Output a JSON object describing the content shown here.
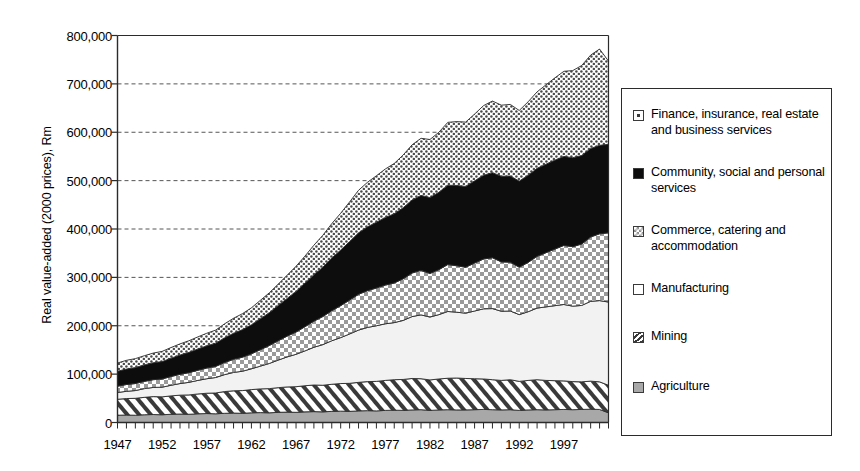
{
  "chart_data": {
    "type": "area",
    "stacked": true,
    "title": "",
    "xlabel": "",
    "ylabel": "Real value-added (2000 prices), Rm",
    "ylim": [
      0,
      800000
    ],
    "ytick_values": [
      0,
      100000,
      200000,
      300000,
      400000,
      500000,
      600000,
      700000,
      800000
    ],
    "ytick_labels": [
      "0",
      "100,000",
      "200,000",
      "300,000",
      "400,000",
      "500,000",
      "600,000",
      "700,000",
      "800,000"
    ],
    "xlim": [
      1947,
      2002
    ],
    "xtick_labels": [
      "1947",
      "1952",
      "1957",
      "1962",
      "1967",
      "1972",
      "1977",
      "1982",
      "1987",
      "1992",
      "1997"
    ],
    "xtick_values": [
      1947,
      1952,
      1957,
      1962,
      1967,
      1972,
      1977,
      1982,
      1987,
      1992,
      1997
    ],
    "minor_ticks": "every year",
    "grid": "horizontal dashed gridlines at each 100,000",
    "legend_position": "right, outside plot",
    "x": [
      1947,
      1948,
      1949,
      1950,
      1951,
      1952,
      1953,
      1954,
      1955,
      1956,
      1957,
      1958,
      1959,
      1960,
      1961,
      1962,
      1963,
      1964,
      1965,
      1966,
      1967,
      1968,
      1969,
      1970,
      1971,
      1972,
      1973,
      1974,
      1975,
      1976,
      1977,
      1978,
      1979,
      1980,
      1981,
      1982,
      1983,
      1984,
      1985,
      1986,
      1987,
      1988,
      1989,
      1990,
      1991,
      1992,
      1993,
      1994,
      1995,
      1996,
      1997,
      1998,
      1999,
      2000,
      2001,
      2002
    ],
    "series": [
      {
        "name": "Agriculture",
        "pattern": "solid-grey",
        "values": [
          15000,
          15500,
          15000,
          16000,
          16500,
          16000,
          17000,
          17500,
          17000,
          18000,
          18500,
          18000,
          19000,
          19500,
          19000,
          20000,
          20500,
          20000,
          21000,
          21500,
          21000,
          22000,
          22500,
          22000,
          23000,
          23500,
          23000,
          24000,
          24500,
          24000,
          25000,
          25500,
          25000,
          26000,
          26500,
          25000,
          26000,
          26500,
          26000,
          26000,
          26500,
          27000,
          26500,
          26000,
          26500,
          25000,
          26000,
          26500,
          26000,
          26500,
          27000,
          26500,
          27000,
          27500,
          27000,
          20000
        ]
      },
      {
        "name": "Mining",
        "pattern": "diagonal-hatch",
        "values": [
          33000,
          34000,
          35000,
          36000,
          37000,
          37000,
          38000,
          39000,
          40000,
          41000,
          42000,
          43000,
          45000,
          46000,
          47000,
          48000,
          49000,
          50000,
          51000,
          52000,
          53000,
          54000,
          55000,
          55000,
          56000,
          57000,
          58000,
          59000,
          60000,
          61000,
          62000,
          63000,
          64000,
          65000,
          64000,
          63000,
          64000,
          65000,
          66000,
          65000,
          64000,
          63000,
          62000,
          61000,
          62000,
          60000,
          61000,
          62000,
          61000,
          60000,
          59000,
          58000,
          57000,
          58000,
          57000,
          57000
        ]
      },
      {
        "name": "Manufacturing",
        "pattern": "light-solid",
        "values": [
          14000,
          15000,
          16000,
          18000,
          19000,
          20000,
          22000,
          24000,
          26000,
          28000,
          30000,
          32000,
          35000,
          38000,
          40000,
          43000,
          47000,
          52000,
          57000,
          62000,
          67000,
          72000,
          78000,
          84000,
          90000,
          95000,
          102000,
          108000,
          112000,
          115000,
          117000,
          118000,
          122000,
          128000,
          132000,
          130000,
          133000,
          138000,
          136000,
          135000,
          140000,
          145000,
          147000,
          143000,
          142000,
          138000,
          142000,
          148000,
          152000,
          155000,
          158000,
          156000,
          158000,
          165000,
          168000,
          172000
        ]
      },
      {
        "name": "Commerce, catering and accommodation",
        "pattern": "checker",
        "values": [
          13000,
          14000,
          14500,
          15000,
          16000,
          17000,
          18000,
          19000,
          20000,
          21000,
          22000,
          23000,
          25000,
          27000,
          29000,
          31000,
          34000,
          37000,
          40000,
          43000,
          46000,
          50000,
          54000,
          58000,
          62000,
          66000,
          70000,
          74000,
          76000,
          78000,
          80000,
          82000,
          86000,
          90000,
          92000,
          90000,
          93000,
          97000,
          96000,
          95000,
          99000,
          103000,
          105000,
          102000,
          101000,
          98000,
          102000,
          107000,
          112000,
          117000,
          122000,
          123000,
          127000,
          133000,
          138000,
          143000
        ]
      },
      {
        "name": "Community, social and personal services",
        "pattern": "solid-black",
        "values": [
          31000,
          32000,
          33000,
          34000,
          35000,
          36000,
          38000,
          40000,
          42000,
          44000,
          46000,
          48000,
          51000,
          54000,
          57000,
          60000,
          64000,
          68000,
          73000,
          78000,
          84000,
          90000,
          96000,
          102000,
          109000,
          115000,
          121000,
          127000,
          132000,
          136000,
          140000,
          143000,
          147000,
          151000,
          155000,
          157000,
          160000,
          164000,
          166000,
          167000,
          170000,
          173000,
          176000,
          177000,
          178000,
          178000,
          180000,
          182000,
          183000,
          184000,
          184000,
          184000,
          183000,
          183000,
          183000,
          183000
        ]
      },
      {
        "name": "Finance, insurance, real estate and business services",
        "pattern": "dotted",
        "values": [
          17000,
          18000,
          18500,
          19000,
          20000,
          21000,
          22000,
          23000,
          24000,
          25000,
          26000,
          27000,
          29000,
          31000,
          33000,
          35000,
          38000,
          41000,
          44000,
          48000,
          52000,
          56000,
          61000,
          66000,
          71000,
          76000,
          82000,
          88000,
          92000,
          96000,
          100000,
          104000,
          109000,
          114000,
          118000,
          120000,
          124000,
          130000,
          132000,
          133000,
          138000,
          144000,
          148000,
          147000,
          148000,
          146000,
          152000,
          158000,
          164000,
          170000,
          176000,
          180000,
          186000,
          193000,
          199000,
          172000
        ]
      }
    ]
  },
  "legend": {
    "items": [
      {
        "label": "Finance, insurance, real estate and business services",
        "pattern": "dotted"
      },
      {
        "label": "Community, social and personal services",
        "pattern": "solid-black"
      },
      {
        "label": "Commerce, catering and accommodation",
        "pattern": "checker"
      },
      {
        "label": "Manufacturing",
        "pattern": "light-solid"
      },
      {
        "label": "Mining",
        "pattern": "diagonal-hatch"
      },
      {
        "label": "Agriculture",
        "pattern": "solid-grey"
      }
    ]
  },
  "colors": {
    "axis": "#2b2b2b",
    "gridline": "#555555",
    "black_fill": "#0d0d0d",
    "grey_fill": "#a8a8a8",
    "light_fill": "#f2f2f2",
    "white_fill": "#ffffff"
  }
}
